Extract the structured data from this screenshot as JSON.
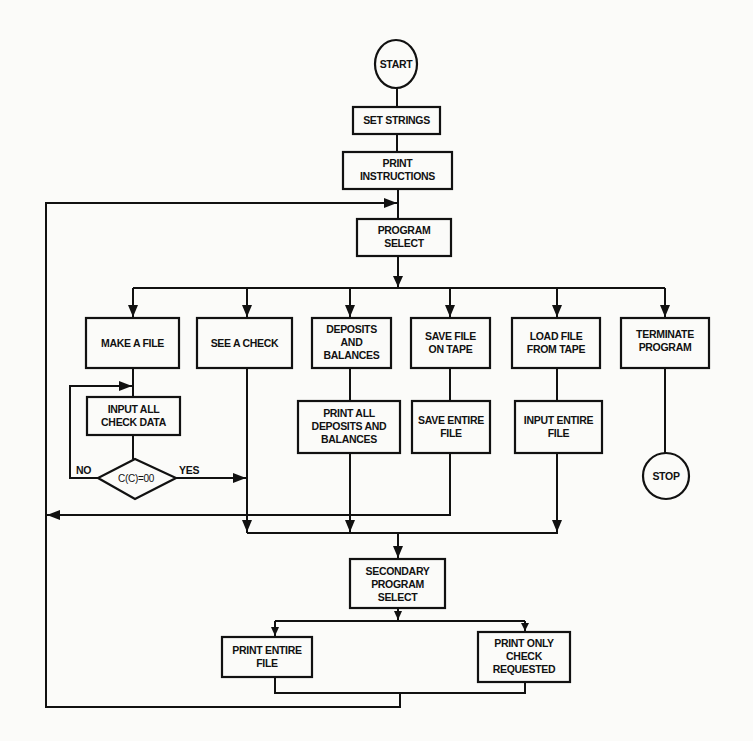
{
  "diagram": {
    "type": "flowchart",
    "colors": {
      "ink": "#111111",
      "paper": "#fbfbf9"
    },
    "nodes": {
      "start": {
        "shape": "circle",
        "lines": [
          "START"
        ]
      },
      "set_strings": {
        "shape": "rect",
        "lines": [
          "SET STRINGS"
        ]
      },
      "print_instructions": {
        "shape": "rect",
        "lines": [
          "PRINT",
          "INSTRUCTIONS"
        ]
      },
      "program_select": {
        "shape": "rect",
        "lines": [
          "PROGRAM",
          "SELECT"
        ]
      },
      "make_a_file": {
        "shape": "rect",
        "lines": [
          "MAKE A FILE"
        ]
      },
      "see_a_check": {
        "shape": "rect",
        "lines": [
          "SEE A CHECK"
        ]
      },
      "deposits_and_balances": {
        "shape": "rect",
        "lines": [
          "DEPOSITS",
          "AND",
          "BALANCES"
        ]
      },
      "save_file_on_tape": {
        "shape": "rect",
        "lines": [
          "SAVE FILE",
          "ON TAPE"
        ]
      },
      "load_file_from_tape": {
        "shape": "rect",
        "lines": [
          "LOAD FILE",
          "FROM TAPE"
        ]
      },
      "terminate_program": {
        "shape": "rect",
        "lines": [
          "TERMINATE",
          "PROGRAM"
        ]
      },
      "input_all_check_data": {
        "shape": "rect",
        "lines": [
          "INPUT ALL",
          "CHECK DATA"
        ]
      },
      "check_condition": {
        "shape": "diamond",
        "lines": [
          "C(C)=00"
        ]
      },
      "print_all_deposits": {
        "shape": "rect",
        "lines": [
          "PRINT ALL",
          "DEPOSITS AND",
          "BALANCES"
        ]
      },
      "save_entire_file": {
        "shape": "rect",
        "lines": [
          "SAVE ENTIRE",
          "FILE"
        ]
      },
      "input_entire_file": {
        "shape": "rect",
        "lines": [
          "INPUT ENTIRE",
          "FILE"
        ]
      },
      "stop": {
        "shape": "circle",
        "lines": [
          "STOP"
        ]
      },
      "secondary_program_select": {
        "shape": "rect",
        "lines": [
          "SECONDARY",
          "PROGRAM",
          "SELECT"
        ]
      },
      "print_entire_file": {
        "shape": "rect",
        "lines": [
          "PRINT ENTIRE",
          "FILE"
        ]
      },
      "print_only_check_requested": {
        "shape": "rect",
        "lines": [
          "PRINT ONLY",
          "CHECK",
          "REQUESTED"
        ]
      }
    },
    "edge_labels": {
      "no": "NO",
      "yes": "YES"
    },
    "edges": [
      [
        "start",
        "set_strings"
      ],
      [
        "set_strings",
        "print_instructions"
      ],
      [
        "print_instructions",
        "program_select"
      ],
      [
        "program_select",
        "make_a_file"
      ],
      [
        "program_select",
        "see_a_check"
      ],
      [
        "program_select",
        "deposits_and_balances"
      ],
      [
        "program_select",
        "save_file_on_tape"
      ],
      [
        "program_select",
        "load_file_from_tape"
      ],
      [
        "program_select",
        "terminate_program"
      ],
      [
        "make_a_file",
        "input_all_check_data"
      ],
      [
        "input_all_check_data",
        "check_condition"
      ],
      [
        "check_condition",
        "input_all_check_data",
        "NO"
      ],
      [
        "check_condition",
        "see_a_check_line",
        "YES"
      ],
      [
        "deposits_and_balances",
        "print_all_deposits"
      ],
      [
        "save_file_on_tape",
        "save_entire_file"
      ],
      [
        "load_file_from_tape",
        "input_entire_file"
      ],
      [
        "terminate_program",
        "stop"
      ],
      [
        "save_entire_file",
        "program_select (return loop)"
      ],
      [
        "see_a_check",
        "secondary_program_select"
      ],
      [
        "print_all_deposits",
        "secondary_program_select"
      ],
      [
        "input_entire_file",
        "secondary_program_select"
      ],
      [
        "secondary_program_select",
        "print_entire_file"
      ],
      [
        "secondary_program_select",
        "print_only_check_requested"
      ],
      [
        "print_entire_file",
        "program_select (return loop)"
      ],
      [
        "print_only_check_requested",
        "program_select (return loop)"
      ]
    ]
  }
}
